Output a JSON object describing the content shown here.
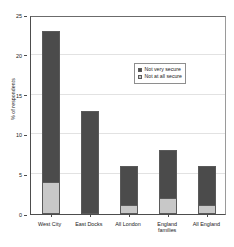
{
  "chart_data": {
    "type": "bar",
    "subtype": "stacked-vertical",
    "title": "",
    "xlabel": "",
    "ylabel": "% of respondents",
    "ylim": [
      0,
      25
    ],
    "yticks": [
      0,
      5,
      10,
      15,
      20,
      25
    ],
    "ytick_labels": [
      "0",
      "5",
      "10",
      "15",
      "20",
      "25"
    ],
    "grid": true,
    "grid_axis": "y",
    "legend_position": "upper-center-right",
    "categories": [
      "West City",
      "East Docks",
      "All London",
      "England families",
      "All England"
    ],
    "category_lines": [
      [
        "West City"
      ],
      [
        "East Docks"
      ],
      [
        "All London"
      ],
      [
        "England",
        "families"
      ],
      [
        "All England"
      ]
    ],
    "series": [
      {
        "name": "Not very secure",
        "color": "#4b4b4b",
        "values": [
          19,
          13,
          5,
          6,
          5
        ]
      },
      {
        "name": "Not at all secure",
        "color": "#c8c8c8",
        "values": [
          4,
          0,
          1,
          2,
          1
        ]
      }
    ],
    "totals": [
      23,
      13,
      6,
      8,
      6
    ]
  },
  "legend": {
    "items": [
      {
        "label": "Not very secure",
        "swatch": "#4b4b4b"
      },
      {
        "label": "Not at all secure",
        "swatch": "#c8c8c8"
      }
    ]
  }
}
